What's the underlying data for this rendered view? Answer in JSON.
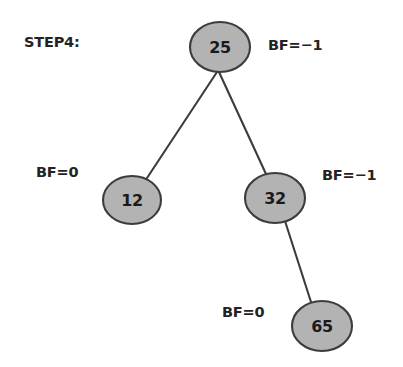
{
  "diagram": {
    "step_label": "STEP4:",
    "background_color": "#ffffff",
    "node_fill": "#b3b3b3",
    "node_stroke": "#3c3c3c",
    "edge_color": "#3c3c3c",
    "text_color": "#232323"
  },
  "nodes": {
    "root": {
      "value": "25",
      "balance_factor": "BF=−1",
      "cx": 220,
      "cy": 47,
      "rx": 30,
      "ry": 25
    },
    "left": {
      "value": "12",
      "balance_factor": "BF=0",
      "cx": 132,
      "cy": 200,
      "rx": 29,
      "ry": 24
    },
    "right": {
      "value": "32",
      "balance_factor": "BF=−1",
      "cx": 275,
      "cy": 198,
      "rx": 30,
      "ry": 25
    },
    "bottom": {
      "value": "65",
      "balance_factor": "BF=0",
      "cx": 322,
      "cy": 326,
      "rx": 30,
      "ry": 25
    }
  },
  "edges": [
    {
      "from": "root",
      "to": "left",
      "x1": 217,
      "y1": 72,
      "x2": 147,
      "y2": 178
    },
    {
      "from": "root",
      "to": "right",
      "x1": 219,
      "y1": 72,
      "x2": 266,
      "y2": 174
    },
    {
      "from": "right",
      "to": "bottom",
      "x1": 285,
      "y1": 221,
      "x2": 311,
      "y2": 302
    }
  ]
}
